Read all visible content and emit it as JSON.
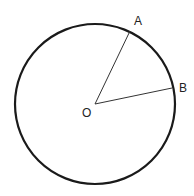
{
  "diagram": {
    "type": "circle-with-radii",
    "circle": {
      "cx": 95,
      "cy": 104,
      "r": 80,
      "stroke": "#1a1a1a",
      "stroke_width": 2.2
    },
    "center": {
      "label": "O",
      "x": 95,
      "y": 104
    },
    "points": [
      {
        "label": "A",
        "x": 130,
        "y": 32
      },
      {
        "label": "B",
        "x": 172,
        "y": 88
      }
    ],
    "radius_color": "#333333"
  },
  "labels": {
    "O": "O",
    "A": "A",
    "B": "B"
  }
}
